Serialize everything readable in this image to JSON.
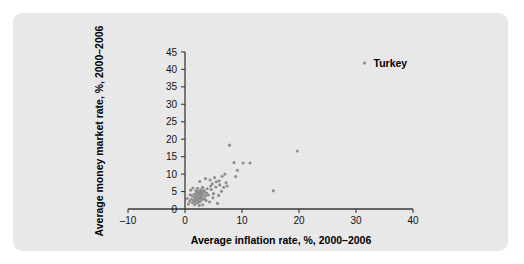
{
  "figure": {
    "background_color": "#ffffff",
    "panel_color": "#e8e8e8",
    "point_color": "#8e8e8e",
    "axis_color": "#3a3a3a"
  },
  "chart_data": {
    "type": "scatter",
    "title": "",
    "xlabel": "Average inflation rate, %, 2000–2006",
    "ylabel": "Average money market rate, %, 2000–2006",
    "xlim": [
      -10,
      40
    ],
    "ylim": [
      0,
      45
    ],
    "xticks": [
      -10,
      0,
      10,
      20,
      30,
      40
    ],
    "xtick_labels": [
      "–10",
      "0",
      "10",
      "20",
      "30",
      "40"
    ],
    "yticks": [
      0,
      5,
      10,
      15,
      20,
      25,
      30,
      35,
      40,
      45
    ],
    "ytick_labels": [
      "0",
      "5",
      "10",
      "15",
      "20",
      "25",
      "30",
      "35",
      "40",
      "45"
    ],
    "grid": false,
    "legend": false,
    "annotations": [
      {
        "label": "Turkey",
        "x": 31.5,
        "y": 41.8
      }
    ],
    "points": [
      [
        31.5,
        41.8
      ],
      [
        7.8,
        18.3
      ],
      [
        19.7,
        16.6
      ],
      [
        8.6,
        13.3
      ],
      [
        10.2,
        13.2
      ],
      [
        11.4,
        13.2
      ],
      [
        9.2,
        11.1
      ],
      [
        7.0,
        10.0
      ],
      [
        6.5,
        9.4
      ],
      [
        8.9,
        9.3
      ],
      [
        5.2,
        9.0
      ],
      [
        3.6,
        8.7
      ],
      [
        4.4,
        8.3
      ],
      [
        6.0,
        8.1
      ],
      [
        2.6,
        7.9
      ],
      [
        7.2,
        7.5
      ],
      [
        4.8,
        7.2
      ],
      [
        6.1,
        6.9
      ],
      [
        15.5,
        5.2
      ],
      [
        5.4,
        6.3
      ],
      [
        3.1,
        6.2
      ],
      [
        1.4,
        6.0
      ],
      [
        2.2,
        5.9
      ],
      [
        3.9,
        5.8
      ],
      [
        4.6,
        5.6
      ],
      [
        2.8,
        5.5
      ],
      [
        3.3,
        5.3
      ],
      [
        1.9,
        5.2
      ],
      [
        2.4,
        5.1
      ],
      [
        3.0,
        5.0
      ],
      [
        2.6,
        4.9
      ],
      [
        3.5,
        4.8
      ],
      [
        2.1,
        4.7
      ],
      [
        2.9,
        4.6
      ],
      [
        3.8,
        4.5
      ],
      [
        2.3,
        4.4
      ],
      [
        1.7,
        4.3
      ],
      [
        2.7,
        4.2
      ],
      [
        3.2,
        4.1
      ],
      [
        2.5,
        4.0
      ],
      [
        4.1,
        4.0
      ],
      [
        1.2,
        3.9
      ],
      [
        2.0,
        3.8
      ],
      [
        3.6,
        3.7
      ],
      [
        2.8,
        3.6
      ],
      [
        2.2,
        3.5
      ],
      [
        1.6,
        3.4
      ],
      [
        3.0,
        3.3
      ],
      [
        2.4,
        3.2
      ],
      [
        4.9,
        3.2
      ],
      [
        1.9,
        3.1
      ],
      [
        2.6,
        3.0
      ],
      [
        3.4,
        2.9
      ],
      [
        1.1,
        2.8
      ],
      [
        2.1,
        2.7
      ],
      [
        2.9,
        2.6
      ],
      [
        1.5,
        2.5
      ],
      [
        2.3,
        2.4
      ],
      [
        3.7,
        2.4
      ],
      [
        0.8,
        2.2
      ],
      [
        1.8,
        2.1
      ],
      [
        2.6,
        2.0
      ],
      [
        4.3,
        2.0
      ],
      [
        1.3,
        1.8
      ],
      [
        2.2,
        1.7
      ],
      [
        5.7,
        1.6
      ],
      [
        0.6,
        1.4
      ],
      [
        1.7,
        1.3
      ],
      [
        3.1,
        1.2
      ],
      [
        2.5,
        1.0
      ],
      [
        6.4,
        5.1
      ],
      [
        5.0,
        4.4
      ],
      [
        5.9,
        3.9
      ],
      [
        6.8,
        6.2
      ],
      [
        4.5,
        6.6
      ],
      [
        0.9,
        4.1
      ],
      [
        0.4,
        3.0
      ],
      [
        1.0,
        5.4
      ],
      [
        5.5,
        7.8
      ],
      [
        7.4,
        6.6
      ]
    ]
  }
}
